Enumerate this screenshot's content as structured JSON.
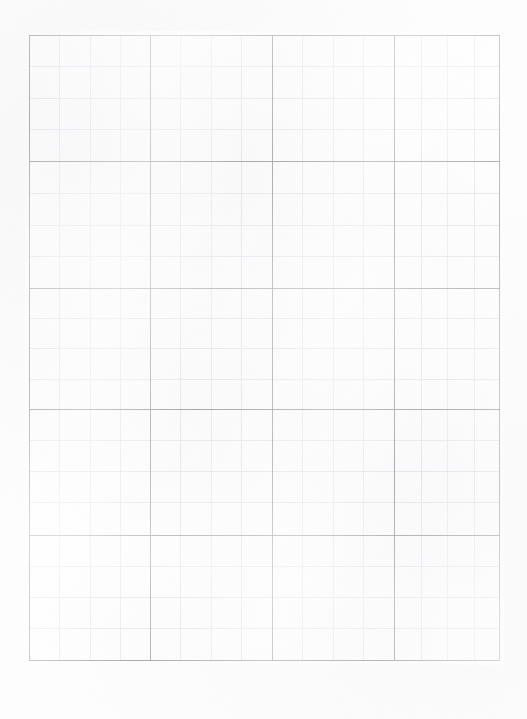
{
  "document": {
    "kind": "scanned-graph-paper",
    "title": "Blank grid / graph paper scan",
    "page_width": 527,
    "page_height": 719,
    "background_color": "#ffffff",
    "content_text": ""
  },
  "grid": {
    "left": 29,
    "top": 35,
    "right": 500,
    "bottom": 661,
    "width": 471,
    "height": 626,
    "major_columns": 4,
    "major_rows": 5,
    "minor_per_major": 4,
    "major_line_color": "#9c9c9e",
    "minor_line_color": "#e4e4e8",
    "major_line_width": 1,
    "minor_line_width": 1,
    "major_x": [
      29,
      150,
      272,
      394,
      500
    ],
    "major_y": [
      35,
      161,
      288,
      409,
      535,
      661
    ],
    "minor_x": [
      59,
      90,
      120,
      180,
      211,
      241,
      302,
      333,
      363,
      421,
      447,
      474
    ],
    "minor_y": [
      66,
      98,
      129,
      193,
      225,
      256,
      318,
      348,
      379,
      440,
      471,
      502,
      566,
      597,
      628
    ],
    "cell_labels": []
  },
  "scan": {
    "noise_opacity": 0.5,
    "paper_tint": "#fafafc",
    "margin_color": "#ffffff"
  }
}
